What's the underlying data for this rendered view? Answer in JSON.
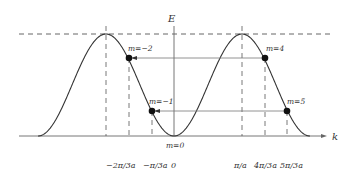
{
  "diagram": {
    "type": "energy-band dispersion (cosine band, extended zone)",
    "axes": {
      "y_label": "E",
      "x_label": "k"
    },
    "tick_labels": [
      {
        "text": "−2π/3a",
        "k_over_pi_a": -0.6667
      },
      {
        "text": "−π/3a",
        "k_over_pi_a": -0.3333
      },
      {
        "text": "0",
        "k_over_pi_a": 0
      },
      {
        "text": "π/a",
        "k_over_pi_a": 1
      },
      {
        "text": "4π/3a",
        "k_over_pi_a": 1.3333
      },
      {
        "text": "5π/3a",
        "k_over_pi_a": 1.6667
      }
    ],
    "points": [
      {
        "label": "m=−2",
        "k_over_pi_a": -0.6667,
        "level": "upper"
      },
      {
        "label": "m=4",
        "k_over_pi_a": 1.3333,
        "level": "upper"
      },
      {
        "label": "m=−1",
        "k_over_pi_a": -0.3333,
        "level": "lower"
      },
      {
        "label": "m=5",
        "k_over_pi_a": 1.6667,
        "level": "lower"
      },
      {
        "label": "m=0",
        "k_over_pi_a": 0,
        "level": "bottom"
      }
    ],
    "arrows": [
      {
        "from": "m=4",
        "to": "m=−2"
      },
      {
        "from": "m=5",
        "to": "m=−1"
      }
    ],
    "colors": {
      "curve": "#333333",
      "axes": "#666666",
      "dashed": "#555555",
      "points": "#111111"
    }
  }
}
